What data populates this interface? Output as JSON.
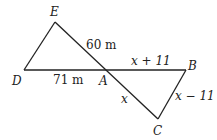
{
  "diagram": {
    "points": {
      "E": {
        "label": "E",
        "x": 55,
        "y": 22
      },
      "D": {
        "label": "D",
        "x": 24,
        "y": 70
      },
      "A": {
        "label": "A",
        "x": 108,
        "y": 70
      },
      "B": {
        "label": "B",
        "x": 186,
        "y": 70
      },
      "C": {
        "label": "C",
        "x": 158,
        "y": 119
      }
    },
    "segments": {
      "EA": "60 m",
      "DA": "71 m",
      "AB": "x + 11",
      "AC": "x",
      "BC": "x − 11"
    },
    "stroke_color": "#222222"
  }
}
